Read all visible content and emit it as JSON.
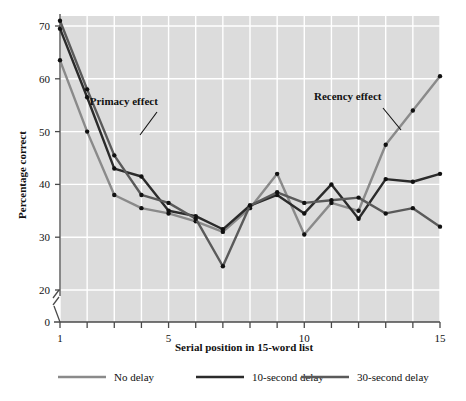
{
  "chart_data": {
    "type": "line",
    "title": "",
    "xlabel": "Serial position in 15-word list",
    "ylabel": "Percentage correct",
    "x": [
      1,
      2,
      3,
      4,
      5,
      6,
      7,
      8,
      9,
      10,
      11,
      12,
      13,
      14,
      15
    ],
    "xlim": [
      1,
      15
    ],
    "ylim": [
      20,
      72
    ],
    "y_axis_break": true,
    "y_ticks": [
      0,
      20,
      30,
      40,
      50,
      60,
      70
    ],
    "x_ticks": [
      1,
      2,
      3,
      4,
      5,
      6,
      7,
      8,
      9,
      10,
      11,
      12,
      13,
      14,
      15
    ],
    "x_tick_labels_shown": [
      1,
      5,
      10,
      15
    ],
    "grid": true,
    "grid_color": "#ffffff",
    "plot_background": "#dcdcdc",
    "legend_position": "bottom",
    "series": [
      {
        "name": "No delay",
        "color": "#8a8a8a",
        "values": [
          63.5,
          50.0,
          38.0,
          35.5,
          34.5,
          33.0,
          31.0,
          35.5,
          42.0,
          30.5,
          36.5,
          35.0,
          47.5,
          54.0,
          60.5
        ]
      },
      {
        "name": "10-second delay",
        "color": "#2b2b2b",
        "values": [
          69.5,
          56.5,
          43.0,
          41.5,
          35.0,
          34.0,
          31.5,
          36.0,
          38.0,
          34.5,
          40.0,
          33.5,
          41.0,
          40.5,
          42.0
        ]
      },
      {
        "name": "30-second delay",
        "color": "#5a5a5a",
        "values": [
          71.0,
          58.0,
          45.5,
          38.0,
          36.5,
          33.5,
          24.5,
          36.0,
          38.5,
          36.5,
          37.0,
          37.5,
          34.5,
          35.5,
          32.0
        ]
      }
    ],
    "annotations": [
      {
        "text": "Primacy effect",
        "x": 3.35,
        "y": 55.0
      },
      {
        "text": "Recency effect",
        "x": 11.6,
        "y": 56.0
      }
    ]
  },
  "legend": {
    "items": [
      {
        "label": "No delay",
        "color": "#8a8a8a"
      },
      {
        "label": "10-second delay",
        "color": "#2b2b2b"
      },
      {
        "label": "30-second delay",
        "color": "#5a5a5a"
      }
    ]
  },
  "axes": {
    "y_tick_labels": [
      "70",
      "60",
      "50",
      "40",
      "30",
      "20",
      "0"
    ],
    "x_tick_labels": [
      "1",
      "5",
      "10",
      "15"
    ]
  }
}
